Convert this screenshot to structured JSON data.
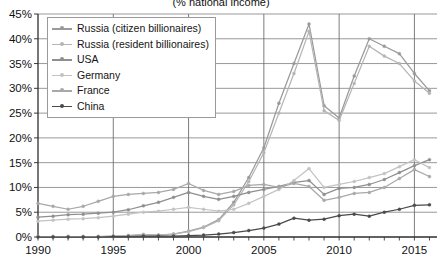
{
  "chart_data": {
    "type": "line",
    "title": "(% national income)",
    "xlabel": "",
    "ylabel": "",
    "xlim": [
      1990,
      2016.5
    ],
    "ylim": [
      0,
      45
    ],
    "ytick_step": 5,
    "ytick_labels": [
      "0%",
      "5%",
      "10%",
      "15%",
      "20%",
      "25%",
      "30%",
      "35%",
      "40%",
      "45%"
    ],
    "xtick_labels": [
      "1990",
      "1995",
      "2000",
      "2005",
      "2010",
      "2015"
    ],
    "xticks": [
      1990,
      1995,
      2000,
      2005,
      2010,
      2015
    ],
    "grid": "horizontal-and-vertical",
    "legend_position": "top-left",
    "x": [
      1990,
      1991,
      1992,
      1993,
      1994,
      1995,
      1996,
      1997,
      1998,
      1999,
      2000,
      2001,
      2002,
      2003,
      2004,
      2005,
      2006,
      2007,
      2008,
      2009,
      2010,
      2011,
      2012,
      2013,
      2014,
      2015,
      2016
    ],
    "series": [
      {
        "name": "Russia (citizen billionaires)",
        "color": "#9a9a9a",
        "values": [
          0.1,
          0.1,
          0.1,
          0.1,
          0.1,
          0.2,
          0.3,
          0.5,
          0.4,
          0.6,
          1.2,
          2.0,
          3.5,
          7.0,
          12.0,
          18.0,
          27.0,
          35.0,
          43.0,
          26.5,
          24.0,
          32.5,
          40.0,
          38.5,
          37.0,
          33.0,
          29.5
        ]
      },
      {
        "name": "Russia (resident billionaires)",
        "color": "#b5b5b5",
        "values": [
          0.1,
          0.1,
          0.1,
          0.1,
          0.1,
          0.2,
          0.3,
          0.5,
          0.4,
          0.6,
          1.1,
          1.9,
          3.3,
          6.5,
          11.2,
          17.0,
          25.0,
          33.0,
          41.5,
          25.5,
          23.5,
          31.0,
          38.5,
          36.5,
          35.0,
          31.5,
          29.0
        ]
      },
      {
        "name": "USA",
        "color": "#8f8f8f",
        "values": [
          4.0,
          4.2,
          4.5,
          4.6,
          4.8,
          5.0,
          5.5,
          6.3,
          7.0,
          8.0,
          9.0,
          8.2,
          7.6,
          8.2,
          9.0,
          9.6,
          10.2,
          11.0,
          11.4,
          8.6,
          9.8,
          10.0,
          10.6,
          11.6,
          13.0,
          14.4,
          15.6
        ]
      },
      {
        "name": "Germany",
        "color": "#c3c3c3",
        "values": [
          3.2,
          3.4,
          3.6,
          3.7,
          3.9,
          4.2,
          4.6,
          5.0,
          5.2,
          5.6,
          6.0,
          5.6,
          5.2,
          5.6,
          6.8,
          8.2,
          9.6,
          11.4,
          13.8,
          10.0,
          10.6,
          11.2,
          12.0,
          12.8,
          14.2,
          15.6,
          14.0
        ]
      },
      {
        "name": "France",
        "color": "#a8a8a8",
        "values": [
          6.8,
          6.2,
          5.6,
          6.2,
          7.2,
          8.2,
          8.6,
          8.8,
          9.0,
          9.6,
          10.8,
          9.4,
          8.6,
          9.2,
          10.4,
          10.6,
          10.0,
          10.8,
          10.2,
          7.4,
          8.0,
          8.8,
          9.0,
          10.0,
          11.8,
          13.6,
          12.2
        ]
      },
      {
        "name": "China",
        "color": "#4a4a4a",
        "values": [
          0.0,
          0.0,
          0.0,
          0.0,
          0.0,
          0.1,
          0.1,
          0.2,
          0.2,
          0.2,
          0.3,
          0.4,
          0.6,
          0.9,
          1.3,
          1.8,
          2.6,
          3.8,
          3.4,
          3.6,
          4.3,
          4.6,
          4.2,
          5.0,
          5.6,
          6.4,
          6.5
        ]
      }
    ]
  }
}
